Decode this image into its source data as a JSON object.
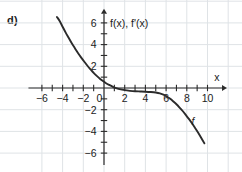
{
  "figure": {
    "panel_label": "d)",
    "background_color": "#ffffff",
    "grid_color": "#dfe3e6",
    "axis_color": "#2b2b2b",
    "curve_color": "#2b2b2b"
  },
  "axes": {
    "x_axis_label": "x",
    "y_axis_label": "f(x), f'(x)",
    "x_ticks_labeled": [
      "-6",
      "-4",
      "-2",
      "0",
      "2",
      "4",
      "6",
      "8",
      "10"
    ],
    "y_ticks_labeled": [
      "6",
      "4",
      "2",
      "-2",
      "-4",
      "-6"
    ],
    "x_origin_label": "0"
  },
  "chart_data": {
    "type": "line",
    "title": "",
    "subtitle": "",
    "xlabel": "x",
    "ylabel": "f(x), f'(x)",
    "xlim": [
      -7,
      11
    ],
    "ylim": [
      -7,
      7
    ],
    "xticks": [
      -6,
      -5,
      -4,
      -3,
      -2,
      -1,
      0,
      1,
      2,
      3,
      4,
      5,
      6,
      7,
      8,
      9,
      10
    ],
    "xticks_labeled": [
      -6,
      -4,
      -2,
      0,
      2,
      4,
      6,
      8,
      10
    ],
    "yticks": [
      -6,
      -5,
      -4,
      -3,
      -2,
      -1,
      0,
      1,
      2,
      3,
      4,
      5,
      6
    ],
    "yticks_labeled": [
      6,
      4,
      2,
      -2,
      -4,
      -6
    ],
    "grid": true,
    "grid_spacing": 2,
    "legend": false,
    "annotations": [
      {
        "text": "f",
        "x": 8.6,
        "y": -3.4,
        "name": "curve-label-f"
      }
    ],
    "series": [
      {
        "name": "f",
        "label": "f",
        "color": "#2b2b2b",
        "x": [
          -4.55,
          -4.3,
          -4.0,
          -3.7,
          -3.4,
          -3.1,
          -2.8,
          -2.5,
          -2.2,
          -1.9,
          -1.6,
          -1.3,
          -1.0,
          -0.7,
          -0.4,
          -0.1,
          0.2,
          0.5,
          0.8,
          1.1,
          1.5,
          2.0,
          2.5,
          3.0,
          3.5,
          4.0,
          4.5,
          5.0,
          5.4,
          5.8,
          6.1,
          6.4,
          6.7,
          7.0,
          7.3,
          7.6,
          7.9,
          8.2,
          8.5,
          8.8,
          9.1,
          9.4,
          9.7
        ],
        "y": [
          6.55,
          6.2,
          5.65,
          5.1,
          4.6,
          4.1,
          3.65,
          3.2,
          2.8,
          2.42,
          2.05,
          1.72,
          1.4,
          1.12,
          0.86,
          0.64,
          0.44,
          0.28,
          0.14,
          0.02,
          -0.1,
          -0.2,
          -0.26,
          -0.3,
          -0.32,
          -0.34,
          -0.37,
          -0.42,
          -0.5,
          -0.64,
          -0.8,
          -1.0,
          -1.24,
          -1.5,
          -1.8,
          -2.12,
          -2.48,
          -2.85,
          -3.25,
          -3.68,
          -4.12,
          -4.6,
          -5.1
        ]
      }
    ]
  }
}
